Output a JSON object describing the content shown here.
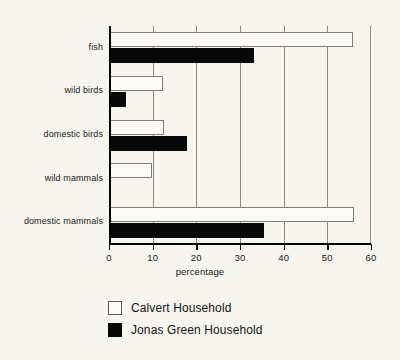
{
  "chart_data": {
    "type": "bar",
    "orientation": "horizontal",
    "title": "",
    "xlabel": "percentage",
    "ylabel": "",
    "xlim": [
      0,
      60
    ],
    "xticks": [
      0,
      10,
      20,
      30,
      40,
      50,
      60
    ],
    "xtick_labels": [
      "0",
      "10",
      "20",
      "30",
      "40",
      "50",
      "60"
    ],
    "grid": true,
    "grid_axis": "x",
    "legend_position": "below-left",
    "categories": [
      "domestic mammals",
      "wild mammals",
      "domestic birds",
      "wild birds",
      "fish"
    ],
    "categories_top_to_bottom": [
      "fish",
      "wild birds",
      "domestic birds",
      "wild mammals",
      "domestic mammals"
    ],
    "series": [
      {
        "name": "Calvert Household",
        "color": "#fcfbf8",
        "edge_color": "#7e7c77",
        "values": [
          56.0,
          9.8,
          12.5,
          12.4,
          55.8
        ],
        "values_top_to_bottom": [
          55.8,
          12.4,
          12.5,
          9.8,
          56.0
        ]
      },
      {
        "name": "Jonas Green Household",
        "color": "#080808",
        "edge_color": "#080808",
        "values": [
          35.5,
          0.0,
          17.8,
          3.9,
          33.2
        ],
        "values_top_to_bottom": [
          33.2,
          3.9,
          17.8,
          0.0,
          35.5
        ]
      }
    ]
  },
  "legend": {
    "entries": [
      {
        "label": "Calvert Household",
        "swatch": "light-square-icon"
      },
      {
        "label": "Jonas Green Household",
        "swatch": "dark-square-icon"
      }
    ]
  },
  "colors": {
    "background": "#f7f5f0",
    "axis": "#000000",
    "gridline": "#8c8a85",
    "text": "#1a1a1a",
    "series_light": "#fcfbf8",
    "series_dark": "#080808"
  }
}
